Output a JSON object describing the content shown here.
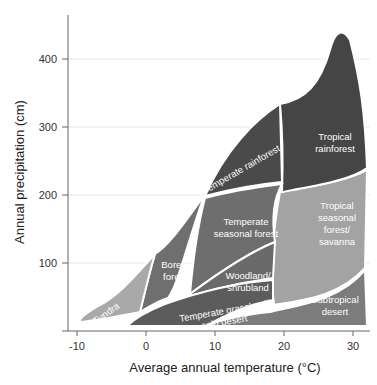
{
  "diagram": {
    "type": "whittaker-biome-diagram",
    "x_axis": {
      "title": "Average annual temperature (°C)",
      "ticks": [
        "-10",
        "0",
        "10",
        "20",
        "30"
      ]
    },
    "y_axis": {
      "title": "Annual precipitation (cm)",
      "ticks": [
        "100",
        "200",
        "300",
        "400"
      ]
    },
    "biomes": {
      "tundra": "Tundra",
      "boreal_1": "Boreal",
      "boreal_2": "forest",
      "temperate_rainforest": "Temperate rainforest",
      "temperate_seasonal_1": "Temperate",
      "temperate_seasonal_2": "seasonal forest",
      "woodland_1": "Woodland/",
      "woodland_2": "shrubland",
      "grassland_1": "Temperate grassland/",
      "grassland_2": "cold desert",
      "tropical_rainforest_1": "Tropical",
      "tropical_rainforest_2": "rainforest",
      "tropical_seasonal_1": "Tropical",
      "tropical_seasonal_2": "seasonal",
      "tropical_seasonal_3": "forest/",
      "tropical_seasonal_4": "savanna",
      "subtropical_desert_1": "Subtropical",
      "subtropical_desert_2": "desert"
    },
    "colors": {
      "tundra": "#a9a9a9",
      "boreal": "#6f6f6f",
      "temperate_rainforest": "#4a4a4a",
      "temperate_seasonal": "#6e6e6e",
      "woodland": "#6a6a6a",
      "grassland": "#5c5c5c",
      "tropical_rainforest": "#454545",
      "tropical_seasonal": "#a3a3a3",
      "subtropical_desert": "#7c7c7c",
      "gridline": "#e6e6e6",
      "axis": "#555555"
    }
  }
}
